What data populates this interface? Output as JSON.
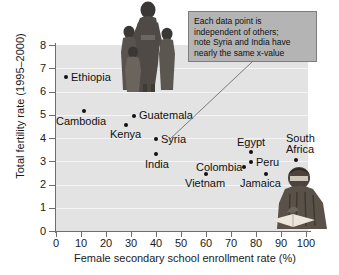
{
  "chart_data": {
    "type": "scatter",
    "title": "",
    "xlabel": "Female secondary school enrollment rate (%)",
    "ylabel": "Total fertility rate (1995–2000)",
    "xlim": [
      0,
      100
    ],
    "ylim": [
      0,
      8
    ],
    "xticks": [
      "0",
      "10",
      "20",
      "30",
      "40",
      "50",
      "60",
      "70",
      "80",
      "90",
      "100"
    ],
    "yticks": [
      "0",
      "1",
      "2",
      "3",
      "4",
      "5",
      "6",
      "7",
      "8"
    ],
    "grid": true,
    "legend": "none",
    "points": [
      {
        "label": "Ethiopia",
        "x": 4,
        "y": 6.65
      },
      {
        "label": "Cambodia",
        "x": 11,
        "y": 5.2
      },
      {
        "label": "Kenya",
        "x": 28,
        "y": 4.6
      },
      {
        "label": "Guatemala",
        "x": 31,
        "y": 5.0
      },
      {
        "label": "Syria",
        "x": 40,
        "y": 4.0
      },
      {
        "label": "India",
        "x": 40,
        "y": 3.35
      },
      {
        "label": "Vietnam",
        "x": 60,
        "y": 2.5
      },
      {
        "label": "Colombia",
        "x": 75,
        "y": 2.8
      },
      {
        "label": "Peru",
        "x": 78,
        "y": 3.0
      },
      {
        "label": "Egypt",
        "x": 78,
        "y": 3.45
      },
      {
        "label": "Jamaica",
        "x": 84,
        "y": 2.5
      },
      {
        "label": "South Africa",
        "x": 96,
        "y": 3.1
      }
    ],
    "annotations": [
      {
        "name": "callout",
        "text": "Each data point is independent of others; note Syria and India have nearly the same x-value",
        "lines": [
          "Each data point is",
          "independent of others;",
          "note Syria and India have",
          "nearly the same x-value"
        ],
        "points_to": "Syria"
      }
    ],
    "colors": {
      "panel": "#e3e3e3",
      "gridline": "#f4f4f4",
      "axis": "#6e6e6e",
      "marker": "#111111",
      "callout_fill": "#b4b4b4",
      "callout_border": "#7d7d7d",
      "text": "#1a1a1a"
    },
    "images": [
      {
        "name": "family-photo",
        "caption": "mother standing with four children"
      },
      {
        "name": "student-reading-photo",
        "caption": "person seated reading an open book"
      }
    ]
  },
  "axes": {
    "y_title": "Total fertility rate (1995–2000)",
    "x_title": "Female secondary school enrollment rate (%)"
  }
}
